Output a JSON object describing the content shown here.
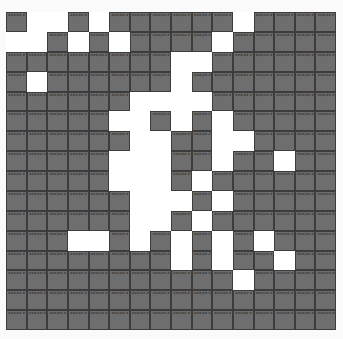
{
  "grid": {
    "columns": 16,
    "rows": 16,
    "colors": {
      "filled": "#6e6e6e",
      "empty": "#ffffff",
      "border": "#3c3c3c",
      "label": "#1e1e1e"
    },
    "cells": [
      "1001011111101111",
      "0010101111011111",
      "1111111100111111",
      "1011111101111111",
      "1111110000111111",
      "1111100101011111",
      "1111110011001111",
      "1111100011011011",
      "1111100010111111",
      "1111110001011111",
      "1111110010111111",
      "1110010101010111",
      "1111111101011011",
      "1111111111101111",
      "1111111111111111",
      "1111111111111111"
    ],
    "label_pattern": "###|##.#"
  }
}
